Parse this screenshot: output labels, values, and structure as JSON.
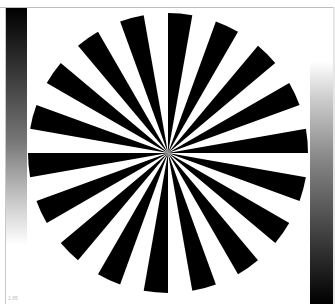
{
  "star": {
    "center_x": 168,
    "center_y": 153,
    "radius": 140,
    "spokes": 18,
    "start_angle_deg": 0,
    "foreground": "#000000",
    "background": "#ffffff"
  },
  "gradients": {
    "left": {
      "from": "#000000",
      "to": "#ffffff",
      "direction": "top-to-bottom"
    },
    "right": {
      "from": "#ffffff",
      "to": "#000000",
      "direction": "top-to-bottom"
    }
  },
  "corner_label": "1.65"
}
